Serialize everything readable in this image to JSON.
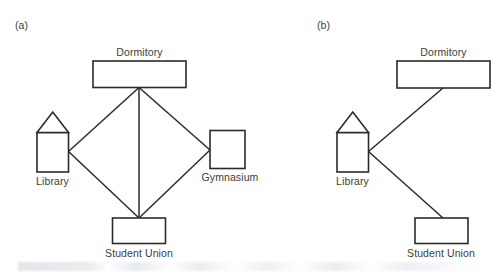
{
  "figure": {
    "width": 499,
    "height": 275,
    "background_color": "#ffffff",
    "stroke_color": "#2b2b2b",
    "text_color": "#3c3c3c"
  },
  "panels": [
    {
      "id": "a",
      "label": "(a)",
      "nodes": [
        {
          "id": "dormitory",
          "label": "Dormitory",
          "shape": "rectangle"
        },
        {
          "id": "library",
          "label": "Library",
          "shape": "house"
        },
        {
          "id": "gymnasium",
          "label": "Gymnasium",
          "shape": "rectangle"
        },
        {
          "id": "student-union",
          "label": "Student Union",
          "shape": "rectangle"
        }
      ],
      "edges": [
        {
          "from": "dormitory",
          "to": "library"
        },
        {
          "from": "dormitory",
          "to": "gymnasium"
        },
        {
          "from": "dormitory",
          "to": "student-union"
        },
        {
          "from": "library",
          "to": "student-union"
        },
        {
          "from": "gymnasium",
          "to": "student-union"
        }
      ]
    },
    {
      "id": "b",
      "label": "(b)",
      "nodes": [
        {
          "id": "dormitory",
          "label": "Dormitory",
          "shape": "rectangle"
        },
        {
          "id": "library",
          "label": "Library",
          "shape": "house"
        },
        {
          "id": "student-union",
          "label": "Student Union",
          "shape": "rectangle"
        }
      ],
      "edges": [
        {
          "from": "library",
          "to": "dormitory"
        },
        {
          "from": "library",
          "to": "student-union"
        }
      ]
    }
  ],
  "captions": {
    "a_dormitory": "Dormitory",
    "a_library": "Library",
    "a_gymnasium": "Gymnasium",
    "a_student_union": "Student Union",
    "b_dormitory": "Dormitory",
    "b_library": "Library",
    "b_student_union": "Student Union"
  }
}
